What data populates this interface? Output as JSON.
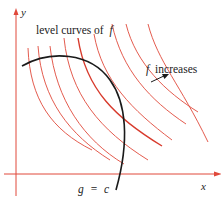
{
  "diagram": {
    "axes": {
      "x_label": "x",
      "y_label": "y",
      "color": "#e0483a"
    },
    "labels": {
      "level_curves": "level curves of",
      "level_curves_f": "f",
      "f_increases_f": "f",
      "f_increases": "increases",
      "constraint_g": "g",
      "constraint_eq": "=",
      "constraint_c": "c"
    },
    "colors": {
      "level_curve": "#e0483a",
      "tangent_level_curve": "#d83a2c",
      "constraint_curve": "#1a1a1a",
      "arrow": "#1a1a1a",
      "text": "#222222"
    },
    "level_curve_count": 9
  }
}
